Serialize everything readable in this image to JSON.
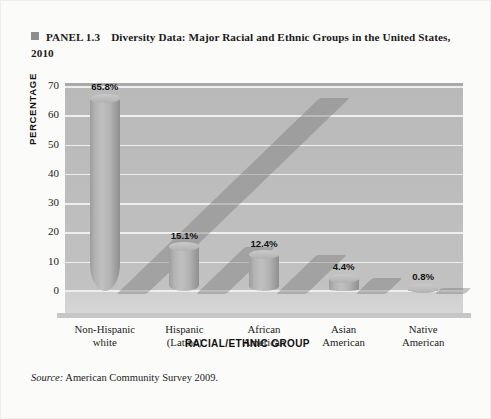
{
  "caption": {
    "bullet": "square-bullet",
    "panel_label": "PANEL 1.3",
    "title": "Diversity Data: Major Racial and Ethnic Groups in the United States, 2010"
  },
  "source": {
    "prefix": "Source:",
    "text": " American Community Survey 2009."
  },
  "chart_data": {
    "type": "bar",
    "title": "Diversity Data: Major Racial and Ethnic Groups in the United States, 2010",
    "categories": [
      "Non-Hispanic white",
      "Hispanic (Latino)",
      "African American",
      "Asian American",
      "Native American"
    ],
    "category_lines": [
      [
        "Non-Hispanic",
        "white"
      ],
      [
        "Hispanic",
        "(Latino)"
      ],
      [
        "African",
        "American"
      ],
      [
        "Asian",
        "American"
      ],
      [
        "Native",
        "American"
      ]
    ],
    "values": [
      65.8,
      15.1,
      12.4,
      4.4,
      0.8
    ],
    "value_labels": [
      "65.8%",
      "15.1%",
      "12.4%",
      "4.4%",
      "0.8%"
    ],
    "xlabel": "RACIAL/ETHNIC GROUP",
    "ylabel": "PERCENTAGE",
    "ylim": [
      0,
      70
    ],
    "yticks": [
      0,
      10,
      20,
      30,
      40,
      50,
      60,
      70
    ],
    "ytick_labels": [
      "0",
      "10",
      "20",
      "30",
      "40",
      "50",
      "60",
      "70"
    ],
    "grid": true,
    "legend": "none",
    "style": "3d-cylinder",
    "colors": {
      "bar": "#b4b4b4",
      "plot_background": "#bdbdbd",
      "floor": "#d2d2d2",
      "gridline": "#f2f2f2",
      "page_background": "#fbfbfa",
      "text": "#1b1b1b"
    }
  }
}
